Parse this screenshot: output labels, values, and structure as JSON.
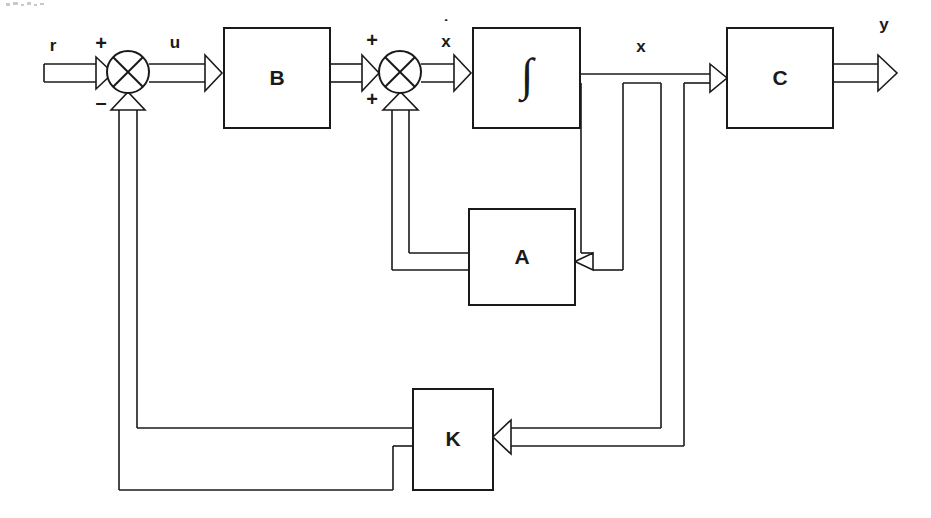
{
  "diagram": {
    "type": "block-diagram",
    "background_color": "#ffffff",
    "line_color": "#1a1a1a",
    "blocks": [
      {
        "id": "B",
        "label": "B",
        "x": 224,
        "y": 28,
        "w": 106,
        "h": 100
      },
      {
        "id": "integrator",
        "label": "∫",
        "x": 473,
        "y": 28,
        "w": 107,
        "h": 100
      },
      {
        "id": "C",
        "label": "C",
        "x": 727,
        "y": 28,
        "w": 106,
        "h": 100
      },
      {
        "id": "A",
        "label": "A",
        "x": 469,
        "y": 209,
        "w": 106,
        "h": 96
      },
      {
        "id": "K",
        "label": "K",
        "x": 413,
        "y": 389,
        "w": 80,
        "h": 101
      }
    ],
    "summers": [
      {
        "id": "sum1",
        "cx": 128,
        "cy": 72,
        "r": 21,
        "signs": [
          "+",
          "−"
        ]
      },
      {
        "id": "sum2",
        "cx": 400,
        "cy": 72,
        "r": 21,
        "signs": [
          "+",
          "+"
        ]
      }
    ],
    "signals": {
      "reference": "r",
      "control": "u",
      "state_derivative": "x",
      "state_derivative_dot": "˙",
      "state": "x",
      "output": "y"
    },
    "sign_labels": {
      "sum1_top": "+",
      "sum1_bottom": "–",
      "sum2_top": "+",
      "sum2_bottom": "+"
    },
    "block_labels": {
      "B": "B",
      "integrator": "∫",
      "C": "C",
      "A": "A",
      "K": "K"
    }
  }
}
